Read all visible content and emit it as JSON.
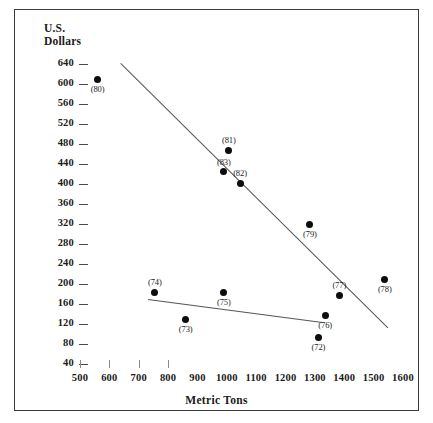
{
  "figure": {
    "y_axis_title_line1": "U.S.",
    "y_axis_title_line2": "Dollars",
    "x_axis_title": "Metric Tons"
  },
  "chart_data": {
    "type": "scatter",
    "title": "",
    "xlabel": "Metric Tons",
    "ylabel": "U.S. Dollars",
    "xlim": [
      450,
      1650
    ],
    "ylim": [
      20,
      660
    ],
    "grid": false,
    "legend": null,
    "xticks": [
      500,
      600,
      700,
      800,
      900,
      1000,
      1100,
      1200,
      1300,
      1400,
      1500,
      1600
    ],
    "yticks": [
      640,
      600,
      560,
      520,
      480,
      440,
      400,
      360,
      320,
      280,
      240,
      200,
      160,
      120,
      80,
      40
    ],
    "point_color": "#0d0d0d",
    "line_color": "#555555",
    "points": [
      {
        "label": "(80)",
        "x": 560,
        "y": 610,
        "label_pos": "below"
      },
      {
        "label": "(81)",
        "x": 1007,
        "y": 468,
        "label_pos": "above"
      },
      {
        "label": "(83)",
        "x": 990,
        "y": 425,
        "label_pos": "above"
      },
      {
        "label": "(82)",
        "x": 1045,
        "y": 402,
        "label_pos": "above"
      },
      {
        "label": "(79)",
        "x": 1283,
        "y": 320,
        "label_pos": "below"
      },
      {
        "label": "(78)",
        "x": 1538,
        "y": 210,
        "label_pos": "below"
      },
      {
        "label": "(77)",
        "x": 1383,
        "y": 178,
        "label_pos": "above"
      },
      {
        "label": "(76)",
        "x": 1335,
        "y": 138,
        "label_pos": "below"
      },
      {
        "label": "(74)",
        "x": 755,
        "y": 184,
        "label_pos": "above"
      },
      {
        "label": "(75)",
        "x": 990,
        "y": 184,
        "label_pos": "below"
      },
      {
        "label": "(73)",
        "x": 860,
        "y": 130,
        "label_pos": "below"
      },
      {
        "label": "(72)",
        "x": 1312,
        "y": 94,
        "label_pos": "below"
      }
    ],
    "trend_lines": [
      {
        "name": "upper-trend-line",
        "x1": 640,
        "y1": 642,
        "x2": 1550,
        "y2": 113
      },
      {
        "name": "lower-trend-line",
        "x1": 730,
        "y1": 170,
        "x2": 1325,
        "y2": 124
      }
    ]
  }
}
